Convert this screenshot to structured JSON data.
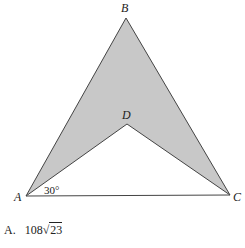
{
  "figure": {
    "vertices": {
      "A": {
        "label": "A",
        "x": 26,
        "y": 196
      },
      "B": {
        "label": "B",
        "x": 126,
        "y": 18
      },
      "C": {
        "label": "C",
        "x": 230,
        "y": 195
      },
      "D": {
        "label": "D",
        "x": 127,
        "y": 124
      }
    },
    "shaded_region": "ABCD",
    "fill_color": "#c8c8c8",
    "stroke_color": "#444444",
    "angle_annotation": {
      "vertex": "A",
      "text": "30°"
    }
  },
  "answer_choice": {
    "letter": "A.",
    "coefficient": "108",
    "sqrt_symbol": "√",
    "radicand": "23"
  }
}
